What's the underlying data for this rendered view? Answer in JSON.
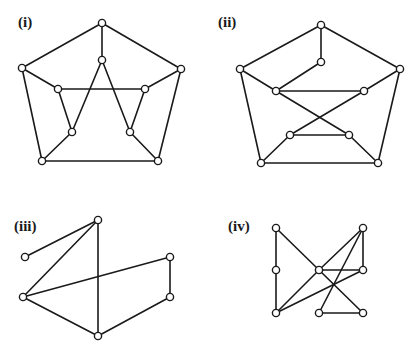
{
  "header": {
    "partial_text": ""
  },
  "graphs": [
    {
      "label": "(i)",
      "label_pos": [
        18,
        14
      ],
      "nodes": [
        [
          102,
          23
        ],
        [
          22,
          68
        ],
        [
          181,
          69
        ],
        [
          42,
          161
        ],
        [
          158,
          161
        ],
        [
          102,
          60
        ],
        [
          58,
          89
        ],
        [
          145,
          89
        ],
        [
          72,
          132
        ],
        [
          130,
          132
        ]
      ],
      "edges": [
        [
          0,
          1
        ],
        [
          0,
          2
        ],
        [
          1,
          3
        ],
        [
          2,
          4
        ],
        [
          3,
          4
        ],
        [
          0,
          5
        ],
        [
          1,
          6
        ],
        [
          2,
          7
        ],
        [
          3,
          8
        ],
        [
          4,
          9
        ],
        [
          6,
          7
        ],
        [
          6,
          8
        ],
        [
          7,
          9
        ],
        [
          5,
          8
        ],
        [
          5,
          9
        ]
      ]
    },
    {
      "label": "(ii)",
      "label_pos": [
        218,
        14
      ],
      "nodes": [
        [
          321,
          25
        ],
        [
          240,
          69
        ],
        [
          400,
          69
        ],
        [
          261,
          163
        ],
        [
          378,
          163
        ],
        [
          321,
          62
        ],
        [
          276,
          91
        ],
        [
          364,
          91
        ],
        [
          290,
          135
        ],
        [
          349,
          135
        ]
      ],
      "edges": [
        [
          0,
          1
        ],
        [
          0,
          2
        ],
        [
          1,
          3
        ],
        [
          2,
          4
        ],
        [
          3,
          4
        ],
        [
          0,
          5
        ],
        [
          5,
          6
        ],
        [
          1,
          6
        ],
        [
          6,
          7
        ],
        [
          7,
          2
        ],
        [
          6,
          9
        ],
        [
          7,
          8
        ],
        [
          8,
          9
        ],
        [
          3,
          8
        ],
        [
          4,
          9
        ]
      ]
    },
    {
      "label": "(iii)",
      "label_pos": [
        14,
        218
      ],
      "nodes": [
        [
          98,
          220
        ],
        [
          25,
          257
        ],
        [
          23,
          297
        ],
        [
          170,
          257
        ],
        [
          170,
          297
        ],
        [
          98,
          336
        ]
      ],
      "edges": [
        [
          0,
          1
        ],
        [
          0,
          2
        ],
        [
          0,
          5
        ],
        [
          2,
          3
        ],
        [
          3,
          4
        ],
        [
          2,
          5
        ],
        [
          4,
          5
        ]
      ]
    },
    {
      "label": "(iv)",
      "label_pos": [
        228,
        218
      ],
      "nodes": [
        [
          276,
          228
        ],
        [
          363,
          228
        ],
        [
          276,
          270
        ],
        [
          319,
          270
        ],
        [
          363,
          270
        ],
        [
          276,
          313
        ],
        [
          319,
          313
        ],
        [
          363,
          313
        ]
      ],
      "edges": [
        [
          0,
          2
        ],
        [
          2,
          5
        ],
        [
          0,
          3
        ],
        [
          3,
          7
        ],
        [
          1,
          3
        ],
        [
          1,
          4
        ],
        [
          1,
          6
        ],
        [
          3,
          4
        ],
        [
          3,
          5
        ],
        [
          4,
          5
        ],
        [
          6,
          7
        ]
      ]
    }
  ],
  "colors": {
    "stroke": "#1a1a1a",
    "node_fill": "#ffffff",
    "background": "#ffffff"
  }
}
